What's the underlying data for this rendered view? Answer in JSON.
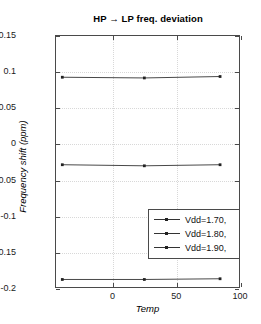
{
  "chart_data": {
    "type": "line",
    "title": "HP → LP freq. deviation",
    "xlabel": "Temp",
    "ylabel": "Frequency shift (ppm)",
    "xlim": [
      -45,
      100
    ],
    "ylim": [
      -0.2,
      0.15
    ],
    "xticks": [
      0,
      50,
      100
    ],
    "xtick_labels": [
      "0",
      "50",
      "100"
    ],
    "yticks": [
      0.15,
      0.1,
      0.05,
      0,
      -0.05,
      -0.1,
      -0.15,
      -0.2
    ],
    "ytick_labels": [
      "0.15",
      "0.1",
      "0.05",
      "0",
      "-0.05",
      "-0.1",
      "-0.15",
      "-0.2"
    ],
    "grid": true,
    "legend_position": "lower right",
    "x": [
      -40,
      25,
      85
    ],
    "series": [
      {
        "name": "Vdd=1.70,",
        "values": [
          0.0925,
          0.0915,
          0.0935
        ]
      },
      {
        "name": "Vdd=1.80,",
        "values": [
          -0.0295,
          -0.031,
          -0.0295
        ]
      },
      {
        "name": "Vdd=1.90,",
        "values": [
          -0.1895,
          -0.1895,
          -0.1885
        ]
      }
    ]
  },
  "legend": {
    "entries": [
      {
        "label": "Vdd=1.70,"
      },
      {
        "label": "Vdd=1.80,"
      },
      {
        "label": "Vdd=1.90,"
      }
    ]
  },
  "colors": {
    "axis": "#4a4a4a",
    "grid": "#d8d8d8",
    "line": "#333333",
    "marker": "#222222",
    "background": "#ffffff"
  }
}
